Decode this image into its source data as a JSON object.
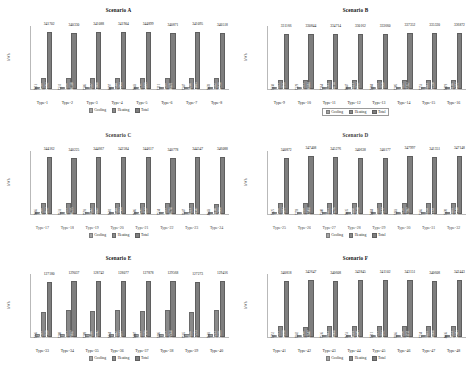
{
  "figure": {
    "panel_count": 6,
    "legend_labels": [
      "Cooling",
      "Heating",
      "Total"
    ],
    "ylabel": "kWh",
    "colors": {
      "cooling": "#a3a3a3",
      "heating": "#8a8a8a",
      "total": "#7e7e7e",
      "background": "#ffffff",
      "gridline": "#b9b9b9"
    }
  },
  "chart_data": [
    {
      "type": "bar",
      "title": "Scenario A",
      "xlabel": "",
      "ylabel": "kWh",
      "ylim": [
        0,
        380000
      ],
      "grid": true,
      "legend_position": "bottom",
      "categories": [
        "Type-1",
        "Type-2",
        "Type-3",
        "Type-4",
        "Type-5",
        "Type-6",
        "Type-7",
        "Type-8"
      ],
      "series": [
        {
          "name": "Cooling",
          "values": [
            7013,
            7131,
            7186,
            6897,
            7043,
            7111,
            7147,
            7078
          ]
        },
        {
          "name": "Heating",
          "values": [
            64366,
            66498,
            63557,
            65564,
            64762,
            66306,
            64208,
            65332
          ]
        },
        {
          "name": "Total",
          "values": [
            341702,
            340330,
            341088,
            341904,
            344899,
            340871,
            341095,
            340518
          ]
        }
      ],
      "total_labels": [
        "341702",
        "340330",
        "341088",
        "341904",
        "344899",
        "340871",
        "341095",
        "340518"
      ]
    },
    {
      "type": "bar",
      "title": "Scenario B",
      "xlabel": "",
      "ylabel": "kWh",
      "ylim": [
        0,
        380000
      ],
      "grid": true,
      "legend_position": "bottom",
      "legend_boxed": true,
      "categories": [
        "Type-9",
        "Type-10",
        "Type-11",
        "Type-12",
        "Type-13",
        "Type-14",
        "Type-15",
        "Type-16"
      ],
      "series": [
        {
          "name": "Cooling",
          "values": [
            7138,
            7129,
            7164,
            7047,
            7204,
            7205,
            7253,
            7419
          ]
        },
        {
          "name": "Heating",
          "values": [
            52425,
            55513,
            55363,
            56623,
            55635,
            55422,
            55461,
            55136
          ]
        },
        {
          "name": "Total",
          "values": [
            331166,
            330844,
            334714,
            330162,
            333660,
            337352,
            335320,
            336872
          ]
        }
      ],
      "total_labels": [
        "331166",
        "330844",
        "334714",
        "330162",
        "333660",
        "337352",
        "335320",
        "336872"
      ]
    },
    {
      "type": "bar",
      "title": "Scenario C",
      "xlabel": "",
      "ylabel": "kWh",
      "ylim": [
        0,
        380000
      ],
      "grid": true,
      "legend_position": "bottom",
      "categories": [
        "Type-17",
        "Type-18",
        "Type-19",
        "Type-20",
        "Type-21",
        "Type-22",
        "Type-23",
        "Type-24"
      ],
      "series": [
        {
          "name": "Cooling",
          "values": [
            7066,
            7633,
            7593,
            7601,
            7606,
            7534,
            7647,
            8643
          ]
        },
        {
          "name": "Heating",
          "values": [
            64366,
            64651,
            63562,
            63564,
            64242,
            64463,
            64323,
            63198
          ]
        },
        {
          "name": "Total",
          "values": [
            344162,
            340225,
            344667,
            342584,
            344617,
            340778,
            344547,
            346088
          ]
        }
      ],
      "total_labels": [
        "344162",
        "340225",
        "344667",
        "342584",
        "344617",
        "340778",
        "344547",
        "346088"
      ]
    },
    {
      "type": "bar",
      "title": "Scenario D",
      "xlabel": "",
      "ylabel": "kWh",
      "ylim": [
        0,
        380000
      ],
      "grid": true,
      "legend_position": "bottom",
      "categories": [
        "Type-25",
        "Type-26",
        "Type-27",
        "Type-28",
        "Type-29",
        "Type-30",
        "Type-31",
        "Type-32"
      ],
      "series": [
        {
          "name": "Cooling",
          "values": [
            7325,
            7259,
            7340,
            7035,
            7484,
            7483,
            7366,
            7370
          ]
        },
        {
          "name": "Heating",
          "values": [
            65378,
            66084,
            65475,
            66438,
            66486,
            66128,
            66654,
            66455
          ]
        },
        {
          "name": "Total",
          "values": [
            340872,
            347408,
            345276,
            340638,
            340177,
            347997,
            341351,
            347148
          ]
        }
      ],
      "total_labels": [
        "340872",
        "347408",
        "345276",
        "340638",
        "340177",
        "347997",
        "341351",
        "347148"
      ]
    },
    {
      "type": "bar",
      "title": "Scenario E",
      "xlabel": "",
      "ylabel": "kWh",
      "ylim": [
        0,
        145000
      ],
      "grid": true,
      "legend_position": "bottom",
      "categories": [
        "Type-33",
        "Type-34",
        "Type-35",
        "Type-36",
        "Type-37",
        "Type-38",
        "Type-39",
        "Type-40"
      ],
      "series": [
        {
          "name": "Cooling",
          "values": [
            7236,
            7208,
            7209,
            7434,
            7407,
            7406,
            7565,
            7603
          ]
        },
        {
          "name": "Heating",
          "values": [
            58389,
            62471,
            59366,
            62462,
            60485,
            62473,
            58656,
            62251
          ]
        },
        {
          "name": "Total",
          "values": [
            127180,
            129037,
            128742,
            128077,
            127878,
            129568,
            127273,
            129416
          ]
        }
      ],
      "total_labels": [
        "127180",
        "129037",
        "128742",
        "128077",
        "127878",
        "129568",
        "127273",
        "129416"
      ]
    },
    {
      "type": "bar",
      "title": "Scenario F",
      "xlabel": "",
      "ylabel": "kWh",
      "ylim": [
        0,
        380000
      ],
      "grid": true,
      "legend_position": "bottom",
      "categories": [
        "Type-41",
        "Type-42",
        "Type-43",
        "Type-44",
        "Type-45",
        "Type-46",
        "Type-47",
        "Type-48"
      ],
      "series": [
        {
          "name": "Cooling",
          "values": [
            7752,
            7842,
            7536,
            7653,
            7711,
            7866,
            7734,
            8036
          ]
        },
        {
          "name": "Heating",
          "values": [
            63513,
            63148,
            63463,
            64593,
            63913,
            63958,
            63491,
            64553
          ]
        },
        {
          "name": "Total",
          "values": [
            340818,
            342647,
            340608,
            342845,
            341102,
            343151,
            340608,
            342443
          ]
        }
      ],
      "total_labels": [
        "340818",
        "342647",
        "340608",
        "342845",
        "341102",
        "343151",
        "340608",
        "342443"
      ]
    }
  ]
}
